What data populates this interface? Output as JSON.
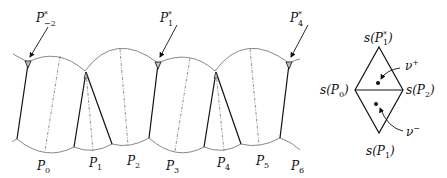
{
  "figure": {
    "top_labels": [
      {
        "id": "P-2*",
        "base": "P",
        "sub": "−2",
        "sup": "*",
        "x": 28,
        "y": 18
      },
      {
        "id": "P1*",
        "base": "P",
        "sub": "1",
        "sup": "*",
        "x": 148,
        "y": 18
      },
      {
        "id": "P4*",
        "base": "P",
        "sub": "4",
        "sup": "*",
        "x": 283,
        "y": 18
      }
    ],
    "bottom_labels": [
      {
        "id": "P0",
        "base": "P",
        "sub": "0",
        "x": 36,
        "y": 167
      },
      {
        "id": "P1",
        "base": "P",
        "sub": "1",
        "x": 88,
        "y": 163
      },
      {
        "id": "P2",
        "base": "P",
        "sub": "2",
        "x": 126,
        "y": 162
      },
      {
        "id": "P3",
        "base": "P",
        "sub": "3",
        "x": 163,
        "y": 167
      },
      {
        "id": "P4",
        "base": "P",
        "sub": "4",
        "x": 217,
        "y": 163
      },
      {
        "id": "P5",
        "base": "P",
        "sub": "5",
        "x": 255,
        "y": 162
      },
      {
        "id": "P6",
        "base": "P",
        "sub": "6",
        "x": 289,
        "y": 167
      }
    ],
    "diamond": {
      "top_label": {
        "text": "s(P",
        "sub": "1",
        "sup": "*",
        "close": ")"
      },
      "left_label": {
        "text": "s(P",
        "sub": "0",
        "close": ")"
      },
      "right_label": {
        "text": "s(P",
        "sub": "2",
        "close": ")"
      },
      "bottom_label": {
        "text": "s(P",
        "sub": "1",
        "close": ")"
      },
      "nu_plus": {
        "base": "ν",
        "sup": "+"
      },
      "nu_minus": {
        "base": "ν",
        "sup": "−"
      }
    }
  }
}
